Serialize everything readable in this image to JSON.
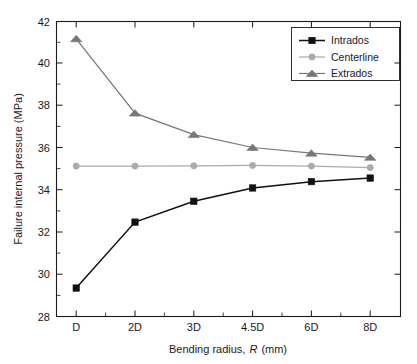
{
  "chart_data": {
    "type": "line",
    "title": "",
    "xlabel": "Bending radius, R (mm)",
    "xlabel_plain": "Bending radius,",
    "xlabel_italic": "R",
    "xlabel_tail": "(mm)",
    "ylabel": "Failure internal pressure (MPa)",
    "categories": [
      "D",
      "2D",
      "3D",
      "4.5D",
      "6D",
      "8D"
    ],
    "ylim": [
      28,
      42
    ],
    "yticks": [
      28,
      30,
      32,
      34,
      36,
      38,
      40,
      42
    ],
    "ytick_labels": [
      "28",
      "30",
      "32",
      "34",
      "36",
      "38",
      "40",
      "42"
    ],
    "grid": false,
    "legend_position": "top-right",
    "series": [
      {
        "name": "Intrados",
        "marker": "square",
        "color": "#111111",
        "values": [
          29.35,
          32.48,
          33.47,
          34.1,
          34.4,
          34.57
        ]
      },
      {
        "name": "Centerline",
        "marker": "circle",
        "color": "#ababab",
        "values": [
          35.14,
          35.14,
          35.15,
          35.17,
          35.14,
          35.07
        ]
      },
      {
        "name": "Extrados",
        "marker": "triangle",
        "color": "#777777",
        "values": [
          41.18,
          37.65,
          36.63,
          36.02,
          35.75,
          35.55
        ]
      }
    ]
  },
  "legend": {
    "entries": [
      {
        "label": "Intrados"
      },
      {
        "label": "Centerline"
      },
      {
        "label": "Extrados"
      }
    ]
  }
}
